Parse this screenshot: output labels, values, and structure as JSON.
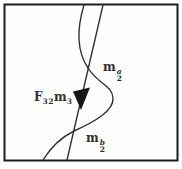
{
  "figure": {
    "background": "#fdfdfb",
    "frame_color": "#1c1c1c",
    "line_color": "#333333",
    "arrow_fill": "#161616",
    "label_color": "#2f2f2f",
    "labels": {
      "epipolar_line": {
        "term1_base": "F",
        "term1_sub": "32",
        "term2_base": "m",
        "term2_sub": "3"
      },
      "point_a": {
        "base": "m",
        "sub": "2",
        "sup": "a"
      },
      "point_b": {
        "base": "m",
        "sub": "2",
        "sup": "b"
      }
    }
  }
}
